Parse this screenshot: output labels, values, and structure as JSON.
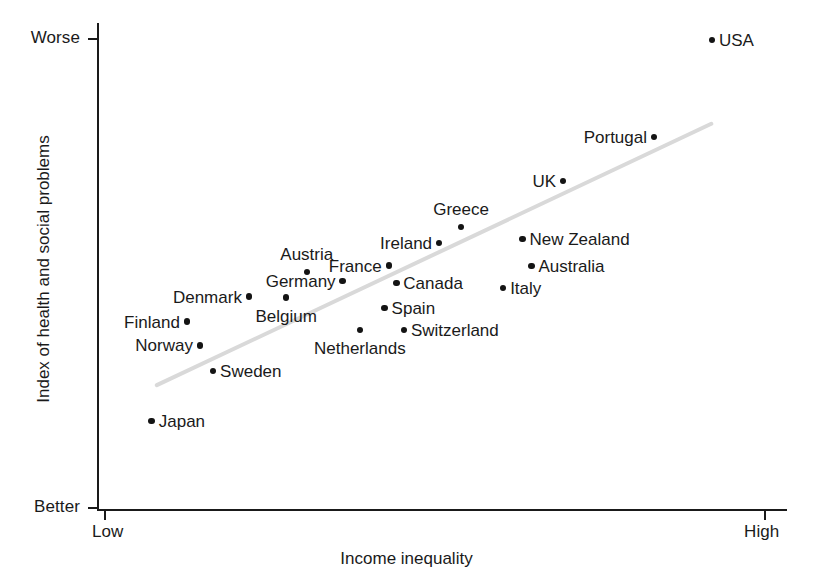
{
  "chart_data": {
    "type": "scatter",
    "title": "",
    "xlabel": "Income inequality",
    "ylabel": "Index of health and social problems",
    "x_axis": {
      "low_label": "Low",
      "high_label": "High",
      "ticks": [
        "Low",
        "High"
      ],
      "range_description": "Low to High income inequality"
    },
    "y_axis": {
      "low_label": "Better",
      "high_label": "Worse",
      "ticks": [
        "Better",
        "Worse"
      ],
      "range_description": "Better to Worse index of health and social problems"
    },
    "grid": false,
    "legend": false,
    "trendline": {
      "present": true,
      "color": "#d9d9d9",
      "description": "Positive-slope linear fit rising from lower-left to upper-right"
    },
    "point_color": "#141414",
    "points": [
      {
        "label": "USA",
        "x": 0.891,
        "y": 0.965,
        "label_pos": "right"
      },
      {
        "label": "Portugal",
        "x": 0.807,
        "y": 0.766,
        "label_pos": "left"
      },
      {
        "label": "UK",
        "x": 0.675,
        "y": 0.676,
        "label_pos": "left"
      },
      {
        "label": "Greece",
        "x": 0.527,
        "y": 0.581,
        "label_pos": "above"
      },
      {
        "label": "Ireland",
        "x": 0.495,
        "y": 0.548,
        "label_pos": "left"
      },
      {
        "label": "New Zealand",
        "x": 0.616,
        "y": 0.556,
        "label_pos": "right"
      },
      {
        "label": "Australia",
        "x": 0.629,
        "y": 0.501,
        "label_pos": "right"
      },
      {
        "label": "Austria",
        "x": 0.303,
        "y": 0.489,
        "label_pos": "above"
      },
      {
        "label": "France",
        "x": 0.422,
        "y": 0.502,
        "label_pos": "left"
      },
      {
        "label": "Germany",
        "x": 0.355,
        "y": 0.47,
        "label_pos": "left"
      },
      {
        "label": "Canada",
        "x": 0.433,
        "y": 0.466,
        "label_pos": "right"
      },
      {
        "label": "Italy",
        "x": 0.588,
        "y": 0.456,
        "label_pos": "right"
      },
      {
        "label": "Denmark",
        "x": 0.219,
        "y": 0.438,
        "label_pos": "left"
      },
      {
        "label": "Belgium",
        "x": 0.273,
        "y": 0.436,
        "label_pos": "below"
      },
      {
        "label": "Spain",
        "x": 0.416,
        "y": 0.415,
        "label_pos": "right"
      },
      {
        "label": "Finland",
        "x": 0.129,
        "y": 0.387,
        "label_pos": "left"
      },
      {
        "label": "Norway",
        "x": 0.148,
        "y": 0.338,
        "label_pos": "left"
      },
      {
        "label": "Netherlands",
        "x": 0.38,
        "y": 0.37,
        "label_pos": "below"
      },
      {
        "label": "Switzerland",
        "x": 0.444,
        "y": 0.37,
        "label_pos": "right"
      },
      {
        "label": "Sweden",
        "x": 0.167,
        "y": 0.285,
        "label_pos": "right"
      },
      {
        "label": "Japan",
        "x": 0.078,
        "y": 0.183,
        "label_pos": "right"
      }
    ]
  },
  "axis_labels": {
    "y_top": "Worse",
    "y_bottom": "Better",
    "x_left": "Low",
    "x_right": "High",
    "x_title": "Income inequality",
    "y_title": "Index of health and social problems"
  },
  "countries": {
    "usa": "USA",
    "portugal": "Portugal",
    "uk": "UK",
    "greece": "Greece",
    "ireland": "Ireland",
    "new_zealand": "New Zealand",
    "australia": "Australia",
    "austria": "Austria",
    "france": "France",
    "germany": "Germany",
    "canada": "Canada",
    "italy": "Italy",
    "denmark": "Denmark",
    "belgium": "Belgium",
    "spain": "Spain",
    "finland": "Finland",
    "norway": "Norway",
    "netherlands": "Netherlands",
    "switzerland": "Switzerland",
    "sweden": "Sweden",
    "japan": "Japan"
  },
  "colors": {
    "axis": "#1a1a1a",
    "point": "#141414",
    "trendline": "#d9d9d9",
    "background": "#ffffff"
  }
}
